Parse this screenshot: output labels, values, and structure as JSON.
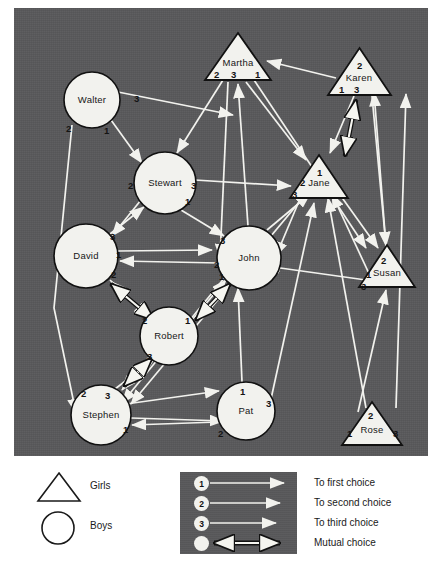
{
  "panel": {
    "background_color": "#58585a",
    "node_fill": "#f2f2ee",
    "line_color": "#f2f2ee"
  },
  "nodes": [
    {
      "id": "walter",
      "name": "Walter",
      "type": "boy",
      "shape": "circle",
      "cx": 78,
      "cy": 92,
      "r": 28,
      "labels": [
        {
          "t": "3",
          "x": 42,
          "y": -6
        },
        {
          "t": "2",
          "x": -26,
          "y": 24
        },
        {
          "t": "1",
          "x": 12,
          "y": 26
        }
      ]
    },
    {
      "id": "stewart",
      "name": "Stewart",
      "type": "boy",
      "shape": "circle",
      "cx": 151,
      "cy": 175,
      "r": 31,
      "labels": [
        {
          "t": "2",
          "x": -37,
          "y": -2
        },
        {
          "t": "3",
          "x": 26,
          "y": -2
        },
        {
          "t": "1",
          "x": 20,
          "y": 14
        }
      ]
    },
    {
      "id": "david",
      "name": "David",
      "type": "boy",
      "shape": "circle",
      "cx": 72,
      "cy": 248,
      "r": 32,
      "labels": [
        {
          "t": "3",
          "x": 24,
          "y": -24
        },
        {
          "t": "1",
          "x": 30,
          "y": -6
        },
        {
          "t": "2",
          "x": 25,
          "y": 14
        }
      ]
    },
    {
      "id": "john",
      "name": "John",
      "type": "boy",
      "shape": "circle",
      "cx": 235,
      "cy": 250,
      "r": 32,
      "labels": [
        {
          "t": "3",
          "x": -29,
          "y": -22
        },
        {
          "t": "2",
          "x": -35,
          "y": 2
        },
        {
          "t": "1",
          "x": -30,
          "y": 14
        }
      ]
    },
    {
      "id": "robert",
      "name": "Robert",
      "type": "boy",
      "shape": "circle",
      "cx": 155,
      "cy": 328,
      "r": 29,
      "labels": [
        {
          "t": "2",
          "x": -27,
          "y": -20
        },
        {
          "t": "1",
          "x": 16,
          "y": -20
        },
        {
          "t": "3",
          "x": -22,
          "y": 16
        }
      ]
    },
    {
      "id": "stephen",
      "name": "Stephen",
      "type": "boy",
      "shape": "circle",
      "cx": 87,
      "cy": 407,
      "r": 30,
      "labels": [
        {
          "t": "2",
          "x": -20,
          "y": -26
        },
        {
          "t": "3",
          "x": 4,
          "y": -24
        },
        {
          "t": "1",
          "x": 22,
          "y": 10
        }
      ]
    },
    {
      "id": "pat",
      "name": "Pat",
      "type": "boy",
      "shape": "circle",
      "cx": 232,
      "cy": 403,
      "r": 29,
      "labels": [
        {
          "t": "1",
          "x": -6,
          "y": -24
        },
        {
          "t": "3",
          "x": 20,
          "y": -12
        },
        {
          "t": "2",
          "x": -28,
          "y": 18
        }
      ]
    },
    {
      "id": "martha",
      "name": "Martha",
      "type": "girl",
      "shape": "triangle",
      "cx": 224,
      "cy": 48,
      "w": 66,
      "h": 47,
      "labels": [
        {
          "t": "2",
          "x": -24,
          "y": 14
        },
        {
          "t": "3",
          "x": -7,
          "y": 14
        },
        {
          "t": "1",
          "x": 17,
          "y": 14
        }
      ]
    },
    {
      "id": "karen",
      "name": "Karen",
      "type": "girl",
      "shape": "triangle",
      "cx": 345,
      "cy": 63,
      "w": 63,
      "h": 47,
      "labels": [
        {
          "t": "2",
          "x": -2,
          "y": -10
        },
        {
          "t": "1",
          "x": -20,
          "y": 14
        },
        {
          "t": "3",
          "x": -5,
          "y": 14
        }
      ]
    },
    {
      "id": "jane",
      "name": "Jane",
      "type": "girl",
      "shape": "triangle",
      "cx": 305,
      "cy": 168,
      "w": 58,
      "h": 43,
      "labels": [
        {
          "t": "1",
          "x": -2,
          "y": -8
        },
        {
          "t": "2",
          "x": -19,
          "y": 2
        },
        {
          "t": "3",
          "x": -27,
          "y": 14
        }
      ]
    },
    {
      "id": "susan",
      "name": "Susan",
      "type": "girl",
      "shape": "triangle",
      "cx": 373,
      "cy": 258,
      "w": 56,
      "h": 42,
      "labels": [
        {
          "t": "2",
          "x": -6,
          "y": -10
        },
        {
          "t": "1",
          "x": -21,
          "y": 4
        },
        {
          "t": "3",
          "x": -26,
          "y": 16
        }
      ]
    },
    {
      "id": "rose",
      "name": "Rose",
      "type": "girl",
      "shape": "triangle",
      "cx": 358,
      "cy": 415,
      "w": 60,
      "h": 43,
      "labels": [
        {
          "t": "2",
          "x": -4,
          "y": -12
        },
        {
          "t": "1",
          "x": -25,
          "y": 6
        },
        {
          "t": "3",
          "x": 21,
          "y": 6
        }
      ]
    }
  ],
  "legend": {
    "shapes": [
      {
        "key": "girls",
        "label": "Girls",
        "symbol": "triangle"
      },
      {
        "key": "boys",
        "label": "Boys",
        "symbol": "circle"
      }
    ],
    "choices": [
      {
        "num": "1",
        "label": "To first choice",
        "arrow": "single"
      },
      {
        "num": "2",
        "label": "To second choice",
        "arrow": "single"
      },
      {
        "num": "3",
        "label": "To third choice",
        "arrow": "single"
      },
      {
        "num": "",
        "label": "Mutual choice",
        "arrow": "double"
      }
    ]
  },
  "chart_data": {
    "type": "diagram",
    "diagram_type": "sociogram",
    "girls": [
      "Martha",
      "Karen",
      "Jane",
      "Susan",
      "Rose"
    ],
    "boys": [
      "Walter",
      "Stewart",
      "David",
      "John",
      "Robert",
      "Stephen",
      "Pat"
    ],
    "legend_entries": [
      "Girls",
      "Boys",
      "To first choice",
      "To second choice",
      "To third choice",
      "Mutual choice"
    ],
    "choice_ranks": [
      1,
      2,
      3
    ],
    "mutual_pairs": [
      [
        "David",
        "Robert"
      ],
      [
        "Robert",
        "John"
      ],
      [
        "Robert",
        "Stephen"
      ],
      [
        "Karen",
        "Jane"
      ]
    ]
  }
}
